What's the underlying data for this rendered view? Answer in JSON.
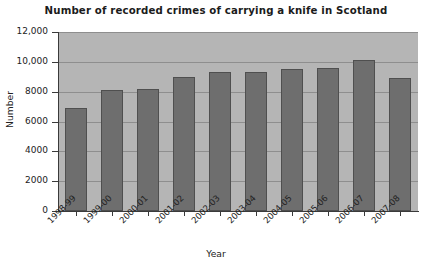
{
  "chart_data": {
    "type": "bar",
    "title": "Number of recorded crimes of carrying a knife in Scotland",
    "xlabel": "Year",
    "ylabel": "Number",
    "categories": [
      "1998-99",
      "1999-00",
      "2000-01",
      "2001-02",
      "2002-03",
      "2003-04",
      "2004-05",
      "2005-06",
      "2006-07",
      "2007-08"
    ],
    "values": [
      6900,
      8100,
      8150,
      9000,
      9300,
      9300,
      9550,
      9600,
      10100,
      8950
    ],
    "ylim": [
      0,
      12000
    ],
    "ytick_values": [
      0,
      2000,
      4000,
      6000,
      8000,
      10000,
      12000
    ],
    "ytick_labels": [
      "0",
      "2000",
      "4000",
      "6000",
      "8000",
      "10,000",
      "12,000"
    ],
    "grid": true,
    "legend": false,
    "colors": {
      "bar_fill": "#6e6e6e",
      "bar_edge": "#4f4f4f",
      "plot_background": "#b5b5b5",
      "figure_background": "#ffffff",
      "gridline": "#8e8e8e",
      "axis": "#3a3a3a",
      "text": "#222222"
    }
  }
}
